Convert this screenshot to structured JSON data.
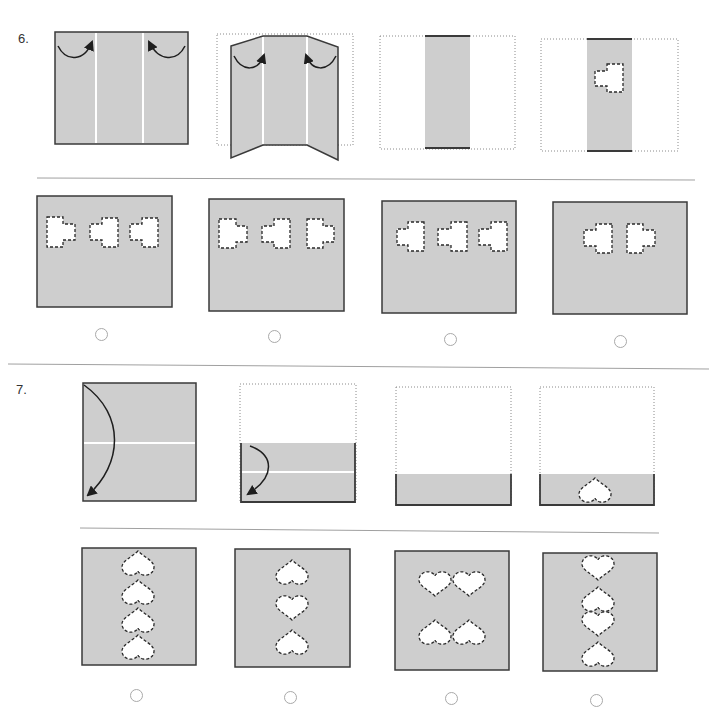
{
  "colors": {
    "paper": "#cecece",
    "edge": "#3a3a3a",
    "cutout": "#ffffff",
    "radio": "#a9a9a9",
    "separator": "#a0a0a0"
  },
  "questions": [
    {
      "number": "6.",
      "steps": [
        {
          "paper": "rectangle",
          "fold_lines": "2 vertical",
          "arrows": [
            "left panel folds right",
            "right panel folds left"
          ]
        },
        {
          "paper": "panels folding inward",
          "fold_lines": "2 vertical",
          "arrows": [
            "left panel folds right",
            "right panel folds left"
          ]
        },
        {
          "paper": "folded vertical strip",
          "outline": "dotted original"
        },
        {
          "paper": "folded vertical strip",
          "cutouts": [
            {
              "shape": "block-with-tab",
              "tab": "left"
            }
          ]
        }
      ],
      "options": [
        {
          "cutouts": [
            {
              "tab": "right"
            },
            {
              "tab": "left"
            },
            {
              "tab": "left"
            }
          ],
          "selected": false
        },
        {
          "cutouts": [
            {
              "tab": "right"
            },
            {
              "tab": "left"
            },
            {
              "tab": "right"
            }
          ],
          "selected": false
        },
        {
          "cutouts": [
            {
              "tab": "left"
            },
            {
              "tab": "left"
            },
            {
              "tab": "left"
            }
          ],
          "selected": false
        },
        {
          "cutouts": [
            {
              "tab": "left"
            },
            {
              "tab": "right"
            }
          ],
          "selected": false
        }
      ]
    },
    {
      "number": "7.",
      "steps": [
        {
          "paper": "square",
          "fold_lines": "1 horizontal",
          "arrows": [
            "top folds down"
          ]
        },
        {
          "paper": "half folded",
          "fold_lines": "1 horizontal",
          "arrows": [
            "top folds down"
          ]
        },
        {
          "paper": "quarter strip",
          "outline": "dotted original"
        },
        {
          "paper": "quarter strip",
          "cutouts": [
            {
              "shape": "heart",
              "orientation": "point-up"
            }
          ]
        }
      ],
      "options": [
        {
          "cutouts": [
            "point-up",
            "point-up",
            "point-up",
            "point-up"
          ],
          "layout": "vertical column",
          "selected": false
        },
        {
          "cutouts": [
            "point-up",
            "point-down",
            "point-up"
          ],
          "layout": "vertical column",
          "selected": false
        },
        {
          "cutouts": [
            "point-down",
            "point-down",
            "point-up",
            "point-up"
          ],
          "layout": "2x2 grid",
          "selected": false
        },
        {
          "cutouts": [
            "point-down",
            "point-up",
            "point-down",
            "point-up"
          ],
          "layout": "vertical column",
          "selected": false
        }
      ]
    }
  ]
}
